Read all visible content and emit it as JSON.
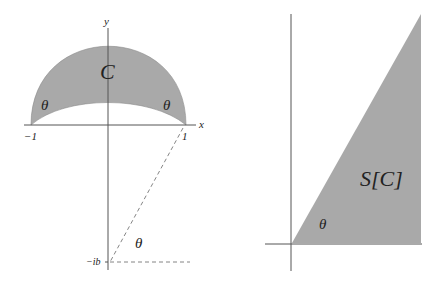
{
  "left_diagram": {
    "axis_x_label": "x",
    "axis_y_label": "y",
    "region_label": "C",
    "angle_label_left": "θ",
    "angle_label_right": "θ",
    "angle_label_bottom": "θ",
    "tick_minus_one": "−1",
    "tick_one": "1",
    "point_label": "−ib"
  },
  "right_diagram": {
    "region_label": "S[C]",
    "angle_label": "θ"
  },
  "colors": {
    "fill": "#a9a9a9",
    "axis": "#555555",
    "dashed": "#777777"
  }
}
